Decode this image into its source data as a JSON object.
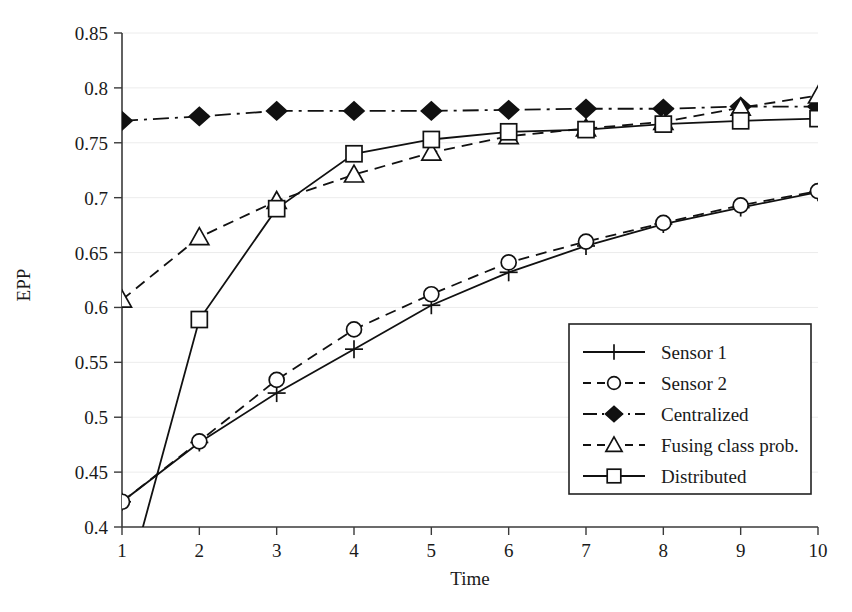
{
  "chart_data": {
    "type": "line",
    "title": "",
    "xlabel": "Time",
    "ylabel": "EPP",
    "x": [
      1,
      2,
      3,
      4,
      5,
      6,
      7,
      8,
      9,
      10
    ],
    "xlim": [
      1,
      10
    ],
    "ylim": [
      0.4,
      0.85
    ],
    "xticks": [
      "1",
      "2",
      "3",
      "4",
      "5",
      "6",
      "7",
      "8",
      "9",
      "10"
    ],
    "yticks": [
      "0.4",
      "0.45",
      "0.5",
      "0.55",
      "0.6",
      "0.65",
      "0.7",
      "0.75",
      "0.8",
      "0.85"
    ],
    "ytick_values": [
      0.4,
      0.45,
      0.5,
      0.55,
      0.6,
      0.65,
      0.7,
      0.75,
      0.8,
      0.85
    ],
    "grid": true,
    "legend_position": "lower right",
    "series": [
      {
        "name": "Sensor 1",
        "marker": "plus",
        "linestyle": "solid",
        "values": [
          0.423,
          0.477,
          0.522,
          0.562,
          0.602,
          0.632,
          0.656,
          0.676,
          0.691,
          0.705
        ]
      },
      {
        "name": "Sensor 2",
        "marker": "circle",
        "linestyle": "dashed",
        "values": [
          0.423,
          0.478,
          0.534,
          0.58,
          0.612,
          0.641,
          0.66,
          0.677,
          0.693,
          0.706
        ]
      },
      {
        "name": "Centralized",
        "marker": "diamond-filled",
        "linestyle": "dashdot",
        "values": [
          0.77,
          0.774,
          0.779,
          0.779,
          0.779,
          0.78,
          0.781,
          0.781,
          0.783,
          0.783
        ]
      },
      {
        "name": "Fusing class prob.",
        "marker": "triangle",
        "linestyle": "dashed",
        "values": [
          0.607,
          0.664,
          0.697,
          0.721,
          0.741,
          0.756,
          0.763,
          0.769,
          0.782,
          0.793
        ]
      },
      {
        "name": "Distributed",
        "marker": "square",
        "linestyle": "solid",
        "values": [
          0.33,
          0.589,
          0.69,
          0.74,
          0.753,
          0.76,
          0.762,
          0.767,
          0.77,
          0.772
        ]
      }
    ]
  },
  "legend": {
    "entries": [
      {
        "label": "Sensor 1"
      },
      {
        "label": "Sensor 2"
      },
      {
        "label": "Centralized"
      },
      {
        "label": "Fusing class prob."
      },
      {
        "label": "Distributed"
      }
    ]
  },
  "axes": {
    "x_title": "Time",
    "y_title": "EPP"
  }
}
